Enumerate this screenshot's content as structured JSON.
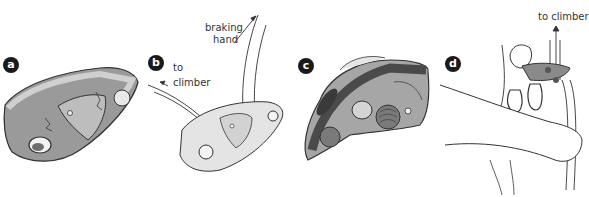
{
  "figure": {
    "panels": [
      {
        "id": "a",
        "badge": "a",
        "subject": "belay-device-closed-side-view"
      },
      {
        "id": "b",
        "badge": "b",
        "subject": "belay-device-rope-path",
        "labels": {
          "to_climber": "to climber",
          "braking_hand_line1": "braking",
          "braking_hand_line2": "hand"
        }
      },
      {
        "id": "c",
        "badge": "c",
        "subject": "belay-device-open-interior"
      },
      {
        "id": "d",
        "badge": "d",
        "subject": "belayer-hands-using-device",
        "labels": {
          "to_climber": "to climber"
        }
      }
    ],
    "colors": {
      "badge": "#1a1a1a",
      "device_dark": "#6e6e6e",
      "device_mid": "#9a9a9a",
      "device_light": "#c8c8c8",
      "line": "#333333"
    }
  }
}
